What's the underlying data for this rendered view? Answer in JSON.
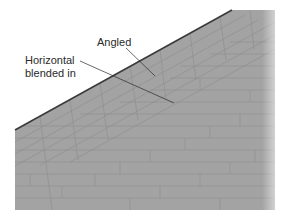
{
  "diagram": {
    "labels": {
      "angled": "Angled",
      "horizontal_line1": "Horizontal",
      "horizontal_line2": "blended in"
    },
    "colors": {
      "surface": "#a3a3a3",
      "course_line": "#8e8e8e",
      "edge": "#3a3a3a",
      "leader": "#2a2a2a",
      "background": "#ffffff"
    },
    "shape": {
      "polygon": [
        [
          15,
          130
        ],
        [
          232,
          10
        ],
        [
          275,
          10
        ],
        [
          275,
          210
        ],
        [
          15,
          210
        ]
      ],
      "edge_start": [
        15,
        130
      ],
      "edge_end": [
        232,
        10
      ]
    },
    "leaders": {
      "angled": {
        "from": [
          126,
          48
        ],
        "to": [
          155,
          76
        ]
      },
      "horizontal": {
        "from": [
          80,
          61
        ],
        "to": [
          174,
          103
        ]
      }
    }
  }
}
